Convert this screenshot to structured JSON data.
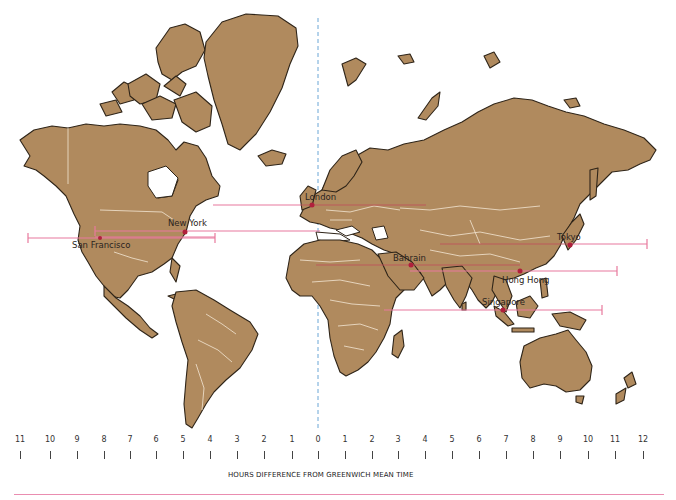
{
  "map": {
    "projection": "Mercator world map",
    "land_color": "#b08a5e",
    "outline_color": "#2e2418",
    "border_color": "#f3e6d3",
    "meridian_color": "#6aa6d6",
    "line_color": "#e8799d"
  },
  "cities": [
    {
      "name": "London",
      "offset": 0
    },
    {
      "name": "New York",
      "offset": -5
    },
    {
      "name": "San Francisco",
      "offset": -8
    },
    {
      "name": "Tokyo",
      "offset": 9
    },
    {
      "name": "Bahrain",
      "offset": 3
    },
    {
      "name": "Hong Hong",
      "offset": 8
    },
    {
      "name": "Singapore",
      "offset": 8
    }
  ],
  "axis": {
    "title": "HOURS DIFFERENCE FROM GREENWICH MEAN TIME",
    "west_ticks": [
      "11",
      "10",
      "9",
      "8",
      "7",
      "6",
      "5",
      "4",
      "3",
      "2",
      "1"
    ],
    "zero": "0",
    "east_ticks": [
      "1",
      "2",
      "3",
      "4",
      "5",
      "6",
      "7",
      "8",
      "9",
      "10",
      "11",
      "12"
    ]
  },
  "colors": {
    "bottom_rule": "#ea8db0"
  }
}
